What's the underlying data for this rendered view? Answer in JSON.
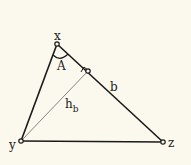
{
  "diagram": {
    "background": "#fbf9ee",
    "stroke": "#1a1a1a",
    "vertices": {
      "x": {
        "label": "x",
        "pt": [
          57,
          44
        ]
      },
      "y": {
        "label": "y",
        "pt": [
          21,
          141
        ]
      },
      "z": {
        "label": "z",
        "pt": [
          163,
          142
        ]
      },
      "foot": {
        "label": "",
        "pt": [
          88,
          71
        ]
      }
    },
    "labels": {
      "angle": "A",
      "side": "b",
      "altitude_main": "h",
      "altitude_sub": "b"
    }
  }
}
